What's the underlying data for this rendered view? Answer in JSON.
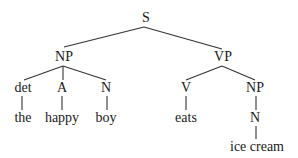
{
  "diagram": {
    "type": "syntax-tree",
    "nodes": [
      {
        "id": "S",
        "label": "S",
        "x": 146,
        "y": 18
      },
      {
        "id": "NP1",
        "label": "NP",
        "x": 64,
        "y": 57
      },
      {
        "id": "VP",
        "label": "VP",
        "x": 223,
        "y": 57
      },
      {
        "id": "det",
        "label": "det",
        "x": 23,
        "y": 88
      },
      {
        "id": "A",
        "label": "A",
        "x": 62,
        "y": 88
      },
      {
        "id": "N1",
        "label": "N",
        "x": 106,
        "y": 88
      },
      {
        "id": "V",
        "label": "V",
        "x": 186,
        "y": 88
      },
      {
        "id": "NP2",
        "label": "NP",
        "x": 255,
        "y": 88
      },
      {
        "id": "the",
        "label": "the",
        "x": 23,
        "y": 118
      },
      {
        "id": "happy",
        "label": "happy",
        "x": 62,
        "y": 118
      },
      {
        "id": "boy",
        "label": "boy",
        "x": 106,
        "y": 118
      },
      {
        "id": "eats",
        "label": "eats",
        "x": 186,
        "y": 118
      },
      {
        "id": "N2",
        "label": "N",
        "x": 255,
        "y": 118
      },
      {
        "id": "icecream",
        "label": "ice cream",
        "x": 257,
        "y": 147
      }
    ],
    "edges": [
      {
        "x1": 144,
        "y1": 27,
        "x2": 64,
        "y2": 47
      },
      {
        "x1": 144,
        "y1": 27,
        "x2": 222,
        "y2": 49
      },
      {
        "x1": 63,
        "y1": 66,
        "x2": 24,
        "y2": 80
      },
      {
        "x1": 63,
        "y1": 66,
        "x2": 63,
        "y2": 80
      },
      {
        "x1": 63,
        "y1": 66,
        "x2": 106,
        "y2": 80
      },
      {
        "x1": 222,
        "y1": 66,
        "x2": 186,
        "y2": 80
      },
      {
        "x1": 222,
        "y1": 66,
        "x2": 255,
        "y2": 80
      },
      {
        "x1": 22,
        "y1": 96,
        "x2": 22,
        "y2": 110
      },
      {
        "x1": 62,
        "y1": 96,
        "x2": 62,
        "y2": 110
      },
      {
        "x1": 107,
        "y1": 96,
        "x2": 107,
        "y2": 110
      },
      {
        "x1": 186,
        "y1": 96,
        "x2": 186,
        "y2": 110
      },
      {
        "x1": 256,
        "y1": 96,
        "x2": 256,
        "y2": 110
      },
      {
        "x1": 256,
        "y1": 126,
        "x2": 256,
        "y2": 139
      }
    ]
  }
}
